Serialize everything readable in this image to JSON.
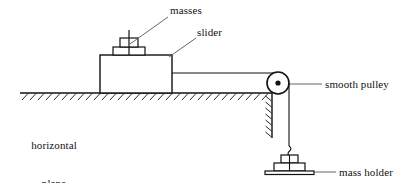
{
  "diagram": {
    "type": "physics-free-body-apparatus-diagram",
    "background_color": "#ffffff",
    "line_color": "#111111",
    "labels": {
      "masses": "masses",
      "slider": "slider",
      "smooth_pulley": "smooth pulley",
      "horizontal_plane_line1": "horizontal",
      "horizontal_plane_line2": "plane",
      "mass_holder": "mass holder"
    },
    "parts": {
      "slider_block": "slider-block",
      "masses_stack": "masses-stack",
      "ground_line": "horizontal-plane-line",
      "ground_hatching": "ground-hatching",
      "wall_edge": "vertical-wall-edge",
      "wall_hatching": "wall-hatching",
      "string_horizontal": "string-slider-to-pulley",
      "string_vertical": "string-pulley-to-holder",
      "pulley_wheel": "pulley-wheel",
      "pulley_axle": "pulley-axle-dot",
      "holder_stack": "mass-holder-stack",
      "holder_hook": "mass-holder-hook",
      "holder_base": "mass-holder-base-plate"
    },
    "leaders": {
      "masses_leader": "masses-leader-line",
      "slider_leader": "slider-leader-line",
      "pulley_leader": "smooth-pulley-leader-line",
      "holder_leader": "mass-holder-leader-line"
    }
  }
}
